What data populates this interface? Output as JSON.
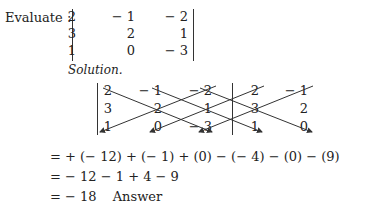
{
  "problem": {
    "label": "Evaluate :",
    "matrix": [
      [
        "2",
        "− 1",
        "− 2"
      ],
      [
        "3",
        "2",
        "1"
      ],
      [
        "1",
        "0",
        "− 3"
      ]
    ]
  },
  "solution": {
    "heading": "Solution.",
    "extended_matrix": [
      [
        "2",
        "− 1",
        "− 2",
        "2",
        "− 1"
      ],
      [
        "3",
        "2",
        "1",
        "3",
        "2"
      ],
      [
        "1",
        "0",
        "− 3",
        "1",
        "0"
      ]
    ],
    "steps": [
      "= + (− 12) + (− 1) + (0) − (− 4) − (0) − (9)",
      "= − 12 − 1 + 4 − 9",
      "= − 18"
    ],
    "answer_label": "Answer"
  }
}
